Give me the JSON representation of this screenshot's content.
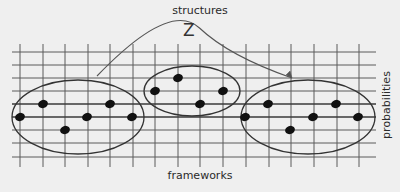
{
  "labels": {
    "top": "structures",
    "bottom": "frameworks",
    "right": "probabilities",
    "arc": "Z"
  },
  "colors": {
    "background": "#efefef",
    "grid": "#5a5a5a",
    "ellipse": "#333333",
    "point": "#111111",
    "arc": "#555555"
  },
  "grid": {
    "x_start": 12,
    "x_end": 376,
    "vertical_lines_x": [
      20,
      43,
      65,
      88,
      110,
      133,
      155,
      178,
      200,
      223,
      246,
      269,
      291,
      314,
      337,
      359
    ],
    "vertical_y_start": 44,
    "vertical_y_end": 167,
    "horizontal_lines_y": [
      52,
      65,
      78,
      91,
      104,
      117,
      130,
      143,
      157
    ],
    "emphasized_lines_y": [
      104,
      117
    ]
  },
  "groups": [
    {
      "name": "left-cluster",
      "ellipse": {
        "cx": 78,
        "cy": 117,
        "rx": 66,
        "ry": 37
      },
      "points": [
        [
          20,
          117
        ],
        [
          43,
          104
        ],
        [
          65,
          130
        ],
        [
          87,
          117
        ],
        [
          110,
          104
        ],
        [
          132,
          117
        ]
      ]
    },
    {
      "name": "middle-cluster",
      "ellipse": {
        "cx": 192,
        "cy": 91,
        "rx": 48,
        "ry": 25
      },
      "points": [
        [
          155,
          91
        ],
        [
          178,
          78
        ],
        [
          200,
          104
        ],
        [
          223,
          91
        ]
      ]
    },
    {
      "name": "right-cluster",
      "ellipse": {
        "cx": 308,
        "cy": 117,
        "rx": 67,
        "ry": 37
      },
      "points": [
        [
          245,
          117
        ],
        [
          268,
          104
        ],
        [
          290,
          130
        ],
        [
          313,
          117
        ],
        [
          336,
          104
        ],
        [
          358,
          117
        ]
      ]
    }
  ],
  "arc": {
    "from": [
      97,
      76
    ],
    "control": [
      170,
      0
    ],
    "to": [
      292,
      78
    ],
    "arrowhead": true
  }
}
